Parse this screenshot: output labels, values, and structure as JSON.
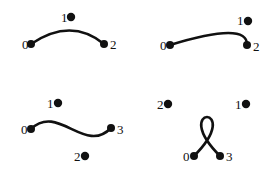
{
  "figure": {
    "title": "",
    "background_color": "#ffffff",
    "stroke_color": "#111111",
    "panel_count": 4
  },
  "panels": [
    {
      "id": "panel-top-left",
      "name": "quadratic-bezier-arch",
      "degree": "quadratic",
      "curve_path": "M 31 44 Q 71 17 104 44",
      "stroke_width": 2.6,
      "points": [
        {
          "label": "0",
          "cx": 31,
          "cy": 44,
          "r": 4.0,
          "label_x": 22,
          "label_y": 49,
          "on_curve": true
        },
        {
          "label": "1",
          "cx": 71,
          "cy": 17,
          "r": 4.2,
          "label_x": 61,
          "label_y": 22,
          "on_curve": false
        },
        {
          "label": "2",
          "cx": 104,
          "cy": 44,
          "r": 4.0,
          "label_x": 110,
          "label_y": 49,
          "on_curve": true
        }
      ]
    },
    {
      "id": "panel-top-right",
      "name": "quadratic-bezier-hook",
      "degree": "quadratic",
      "curve_path": "M 170 45 Q 248 21 247 45",
      "stroke_width": 2.6,
      "points": [
        {
          "label": "0",
          "cx": 170,
          "cy": 45,
          "r": 4.0,
          "label_x": 160,
          "label_y": 50,
          "on_curve": true
        },
        {
          "label": "1",
          "cx": 248,
          "cy": 21,
          "r": 4.2,
          "label_x": 237,
          "label_y": 25,
          "on_curve": false
        },
        {
          "label": "2",
          "cx": 247,
          "cy": 45,
          "r": 4.0,
          "label_x": 253,
          "label_y": 51,
          "on_curve": true
        }
      ]
    },
    {
      "id": "panel-bottom-left",
      "name": "cubic-bezier-s-curve",
      "degree": "cubic",
      "curve_path": "M 31 129 C 58 103 85 155 111 128",
      "stroke_width": 2.6,
      "points": [
        {
          "label": "0",
          "cx": 31,
          "cy": 129,
          "r": 4.0,
          "label_x": 21,
          "label_y": 134,
          "on_curve": true
        },
        {
          "label": "1",
          "cx": 58,
          "cy": 103,
          "r": 4.2,
          "label_x": 47,
          "label_y": 108,
          "on_curve": false
        },
        {
          "label": "2",
          "cx": 85,
          "cy": 156,
          "r": 4.2,
          "label_x": 74,
          "label_y": 161,
          "on_curve": false
        },
        {
          "label": "3",
          "cx": 111,
          "cy": 128,
          "r": 4.0,
          "label_x": 117,
          "label_y": 134,
          "on_curve": true
        }
      ]
    },
    {
      "id": "panel-bottom-right",
      "name": "cubic-bezier-loop",
      "degree": "cubic",
      "curve_path": "M 194 156 C 246 104 168 104 220 156",
      "stroke_width": 2.6,
      "points": [
        {
          "label": "2",
          "cx": 168,
          "cy": 104,
          "r": 4.2,
          "label_x": 157,
          "label_y": 109,
          "on_curve": false
        },
        {
          "label": "1",
          "cx": 246,
          "cy": 104,
          "r": 4.2,
          "label_x": 235,
          "label_y": 109,
          "on_curve": false
        },
        {
          "label": "0",
          "cx": 194,
          "cy": 156,
          "r": 4.0,
          "label_x": 183,
          "label_y": 161,
          "on_curve": true
        },
        {
          "label": "3",
          "cx": 220,
          "cy": 156,
          "r": 4.0,
          "label_x": 226,
          "label_y": 161,
          "on_curve": true
        }
      ]
    }
  ]
}
